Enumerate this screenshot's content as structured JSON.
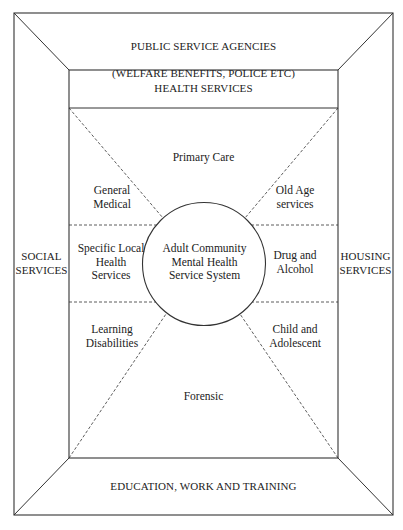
{
  "diagram": {
    "outer_top": {
      "line1": "PUBLIC SERVICE AGENCIES",
      "line2": "(WELFARE BENEFITS, POLICE ETC)"
    },
    "outer_left": "SOCIAL\nSERVICES",
    "outer_right": "HOUSING\nSERVICES",
    "outer_bottom": "EDUCATION, WORK AND TRAINING",
    "inner_header": "HEALTH SERVICES",
    "segments": {
      "top": "Primary Care",
      "upper_left": "General\nMedical",
      "upper_right": "Old Age\nservices",
      "middle_left": "Specific Local\nHealth\nServices",
      "middle_right": "Drug and\nAlcohol",
      "lower_left": "Learning\nDisabilities",
      "lower_right": "Child and\nAdolescent",
      "bottom": "Forensic"
    },
    "center": "Adult Community\nMental Health\nService System"
  },
  "colors": {
    "line": "#333333",
    "text": "#222222",
    "background": "#ffffff"
  }
}
